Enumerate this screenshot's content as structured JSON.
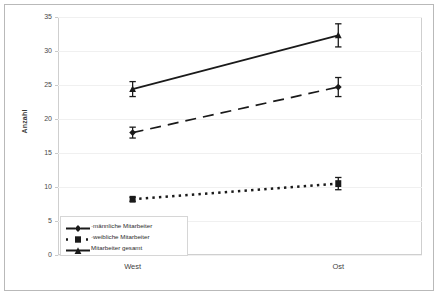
{
  "chart_data": {
    "type": "line",
    "title": "",
    "xlabel": "",
    "ylabel": "Anzahl",
    "categories": [
      "West",
      "Ost"
    ],
    "ylim": [
      0,
      35
    ],
    "yticks": [
      0,
      5,
      10,
      15,
      20,
      25,
      30,
      35
    ],
    "grid": true,
    "legend_position": "bottom-left",
    "errorbars": true,
    "series": [
      {
        "name": "männliche Mitarbeiter",
        "legend_label": "·männliche Mitarbeiter",
        "values": [
          18.0,
          24.7
        ],
        "errors": [
          0.8,
          1.4
        ],
        "line_style": "dashed",
        "marker": "diamond",
        "color": "#1a1a1a"
      },
      {
        "name": "weibliche Mitarbeiter",
        "legend_label": "·weibliche Mitarbeiter",
        "values": [
          8.2,
          10.5
        ],
        "errors": [
          0.3,
          0.9
        ],
        "line_style": "dotted",
        "marker": "square",
        "color": "#1a1a1a"
      },
      {
        "name": "Mitarbeiter gesamt",
        "legend_label": "Mitarbeiter gesamt",
        "values": [
          24.4,
          32.3
        ],
        "errors": [
          1.1,
          1.7
        ],
        "line_style": "solid",
        "marker": "triangle",
        "color": "#1a1a1a"
      }
    ]
  },
  "axis": {
    "y_tick_labels": [
      "0",
      "5",
      "10",
      "15",
      "20",
      "25",
      "30",
      "35"
    ],
    "x_tick_labels": [
      "West",
      "Ost"
    ],
    "y_axis_title": "Anzahl"
  }
}
